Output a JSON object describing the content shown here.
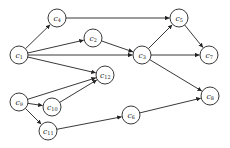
{
  "diagram": {
    "type": "directed-graph",
    "node_radius": 9,
    "colors": {
      "stroke": "#222222",
      "fill": "#ffffff",
      "background": "#ffffff"
    },
    "nodes": [
      {
        "id": "c1",
        "base": "c",
        "sub": "1",
        "x": 19,
        "y": 55
      },
      {
        "id": "c4",
        "base": "c",
        "sub": "4",
        "x": 57,
        "y": 18
      },
      {
        "id": "c2",
        "base": "c",
        "sub": "2",
        "x": 93,
        "y": 38
      },
      {
        "id": "c3",
        "base": "c",
        "sub": "3",
        "x": 142,
        "y": 55
      },
      {
        "id": "c5",
        "base": "c",
        "sub": "5",
        "x": 179,
        "y": 18
      },
      {
        "id": "c7",
        "base": "c",
        "sub": "7",
        "x": 209,
        "y": 55
      },
      {
        "id": "c12",
        "base": "c",
        "sub": "12",
        "x": 105,
        "y": 75
      },
      {
        "id": "c9",
        "base": "c",
        "sub": "9",
        "x": 19,
        "y": 102
      },
      {
        "id": "c10",
        "base": "c",
        "sub": "10",
        "x": 52,
        "y": 107
      },
      {
        "id": "c11",
        "base": "c",
        "sub": "11",
        "x": 48,
        "y": 131
      },
      {
        "id": "c6",
        "base": "c",
        "sub": "6",
        "x": 131,
        "y": 115
      },
      {
        "id": "c8",
        "base": "c",
        "sub": "8",
        "x": 210,
        "y": 96
      }
    ],
    "edges": [
      {
        "from": "c1",
        "to": "c4"
      },
      {
        "from": "c1",
        "to": "c2"
      },
      {
        "from": "c1",
        "to": "c3"
      },
      {
        "from": "c1",
        "to": "c12"
      },
      {
        "from": "c4",
        "to": "c5"
      },
      {
        "from": "c2",
        "to": "c3"
      },
      {
        "from": "c3",
        "to": "c5"
      },
      {
        "from": "c3",
        "to": "c7"
      },
      {
        "from": "c3",
        "to": "c8"
      },
      {
        "from": "c5",
        "to": "c7"
      },
      {
        "from": "c9",
        "to": "c12"
      },
      {
        "from": "c9",
        "to": "c10"
      },
      {
        "from": "c9",
        "to": "c11"
      },
      {
        "from": "c10",
        "to": "c12"
      },
      {
        "from": "c11",
        "to": "c6"
      },
      {
        "from": "c6",
        "to": "c8"
      }
    ]
  }
}
